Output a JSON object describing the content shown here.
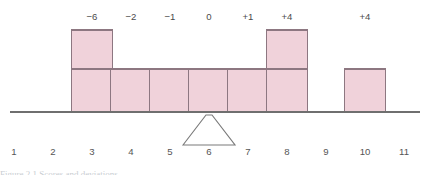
{
  "figure": {
    "background_color": "#ffffff",
    "caption_fragment": "Figure 2.1  Scores and deviations"
  },
  "style": {
    "bar_fill": "#f0d2da",
    "bar_stroke": "#8d7781",
    "axis_color": "#6f6f6f",
    "fulcrum_stroke": "#7a7a7a",
    "label_color": "#4c4c4c",
    "tick_color": "#555555"
  },
  "geometry": {
    "width": 431,
    "height": 175,
    "baseline_y": 112,
    "axis_x_start": 10,
    "axis_x_end": 420,
    "unit_width": 39,
    "bar_width": 41,
    "single_bar_top": 69,
    "double_bar_top": 30,
    "dev_label_y": 20,
    "tick_label_y": 155,
    "fulcrum_apex_y": 115,
    "fulcrum_base_y": 145,
    "fulcrum_half_base": 26,
    "fulcrum_apex_flat": 3
  },
  "chart_data": {
    "type": "bar",
    "xlabel": "",
    "ylabel": "",
    "grid": false,
    "legend": null,
    "axis": {
      "tick_labels": [
        "1",
        "2",
        "3",
        "4",
        "5",
        "6",
        "7",
        "8",
        "9",
        "10",
        "11"
      ],
      "tick_values": [
        1,
        2,
        3,
        4,
        5,
        6,
        7,
        8,
        9,
        10,
        11
      ],
      "xlim": [
        0.5,
        11.5
      ]
    },
    "fulcrum": {
      "position": 6,
      "label": "mean",
      "shown": true
    },
    "bars": [
      {
        "position": 3,
        "height_units": 2,
        "deviation_label": "-6",
        "deviation_value": -6
      },
      {
        "position": 4,
        "height_units": 1,
        "deviation_label": "-2",
        "deviation_value": -2
      },
      {
        "position": 5,
        "height_units": 1,
        "deviation_label": "-1",
        "deviation_value": -1
      },
      {
        "position": 6,
        "height_units": 1,
        "deviation_label": "0",
        "deviation_value": 0
      },
      {
        "position": 7,
        "height_units": 1,
        "deviation_label": "+1",
        "deviation_value": 1
      },
      {
        "position": 8,
        "height_units": 2,
        "deviation_label": "+4",
        "deviation_value": 4
      },
      {
        "position": 10,
        "height_units": 1,
        "deviation_label": "+4",
        "deviation_value": 4
      }
    ],
    "categories": [
      "3",
      "4",
      "5",
      "6",
      "7",
      "8",
      "10"
    ],
    "values": [
      2,
      1,
      1,
      1,
      1,
      2,
      1
    ],
    "data_labels": [
      "-6",
      "-2",
      "-1",
      "0",
      "+1",
      "+4",
      "+4"
    ]
  }
}
